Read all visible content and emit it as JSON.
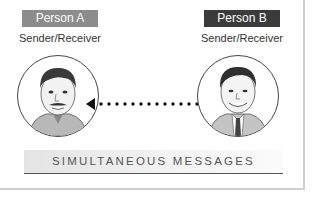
{
  "person_a": {
    "label": "Person A",
    "role": "Sender/Receiver",
    "label_color": "#8c8c8c",
    "portrait": "man-with-mustache-portrait"
  },
  "person_b": {
    "label": "Person B",
    "role": "Sender/Receiver",
    "label_color": "#3b3b3b",
    "portrait": "man-with-tie-portrait"
  },
  "connector": {
    "type": "dotted-double-arrow",
    "icon": "bidirectional-arrow-icon"
  },
  "caption": "SIMULTANEOUS MESSAGES"
}
